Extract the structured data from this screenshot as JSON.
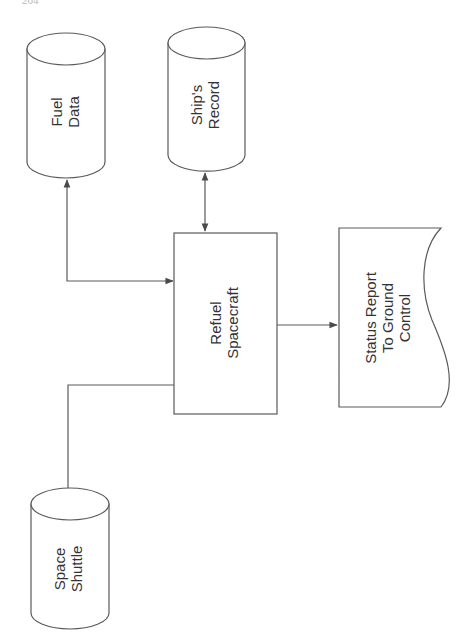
{
  "page": {
    "header_fragment": "204"
  },
  "diagram": {
    "type": "data-flow",
    "orientation": "rotated-90",
    "nodes": [
      {
        "id": "fuel_data",
        "shape": "cylinder",
        "lines": [
          "Fuel",
          "Data"
        ]
      },
      {
        "id": "ships_record",
        "shape": "cylinder",
        "lines": [
          "Ship's",
          "Record"
        ]
      },
      {
        "id": "refuel_spacecraft",
        "shape": "process-box",
        "lines": [
          "Refuel",
          "Spacecraft"
        ]
      },
      {
        "id": "status_report",
        "shape": "document",
        "lines": [
          "Status Report",
          "To Ground",
          "Control"
        ]
      },
      {
        "id": "space_shuttle",
        "shape": "cylinder",
        "lines": [
          "Space",
          "Shuttle"
        ]
      }
    ],
    "edges": [
      {
        "from": "refuel_spacecraft",
        "to": "fuel_data",
        "direction": "bidirectional"
      },
      {
        "from": "refuel_spacecraft",
        "to": "ships_record",
        "direction": "bidirectional"
      },
      {
        "from": "refuel_spacecraft",
        "to": "status_report",
        "direction": "forward"
      },
      {
        "from": "space_shuttle",
        "to": "refuel_spacecraft",
        "direction": "none"
      }
    ],
    "colors": {
      "stroke": "#5a5a5a",
      "text": "#333333",
      "background": "#ffffff"
    }
  }
}
